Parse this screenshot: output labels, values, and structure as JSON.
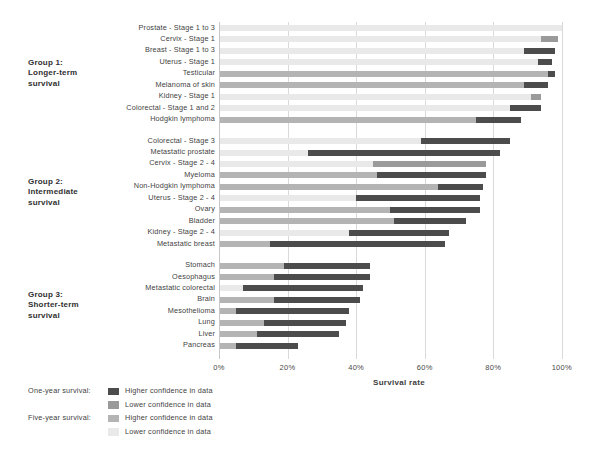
{
  "chart": {
    "type": "bar",
    "title": "",
    "xlabel": "Survival rate",
    "ylabel": "",
    "xlim": [
      0,
      105
    ],
    "xticks": [
      "0%",
      "20%",
      "40%",
      "60%",
      "80%",
      "100%"
    ],
    "xtick_values": [
      0,
      20,
      40,
      60,
      80,
      100
    ],
    "grid": "vertical",
    "orientation": "horizontal",
    "legend_position": "bottom-left"
  },
  "groups": [
    {
      "caption": "Group 1:\nLonger-term\nsurvival",
      "caption_lines": [
        "Group 1:",
        "Longer-term",
        "survival"
      ],
      "rows": [
        {
          "label": "Prostate - Stage 1 to 3",
          "five_year": 100,
          "one_year": 100,
          "five_year_confidence": "lower",
          "one_year_confidence": "lower"
        },
        {
          "label": "Cervix - Stage 1",
          "five_year": 94,
          "one_year": 99,
          "five_year_confidence": "lower",
          "one_year_confidence": "lower"
        },
        {
          "label": "Breast - Stage 1 to 3",
          "five_year": 89,
          "one_year": 98,
          "five_year_confidence": "lower",
          "one_year_confidence": "higher"
        },
        {
          "label": "Uterus - Stage 1",
          "five_year": 93,
          "one_year": 97,
          "five_year_confidence": "lower",
          "one_year_confidence": "higher"
        },
        {
          "label": "Testicular",
          "five_year": 96,
          "one_year": 98,
          "five_year_confidence": "higher",
          "one_year_confidence": "higher"
        },
        {
          "label": "Melanoma of skin",
          "five_year": 89,
          "one_year": 96,
          "five_year_confidence": "higher",
          "one_year_confidence": "higher"
        },
        {
          "label": "Kidney - Stage 1",
          "five_year": 91,
          "one_year": 94,
          "five_year_confidence": "lower",
          "one_year_confidence": "lower"
        },
        {
          "label": "Colorectal - Stage 1 and 2",
          "five_year": 85,
          "one_year": 94,
          "five_year_confidence": "lower",
          "one_year_confidence": "higher"
        },
        {
          "label": "Hodgkin lymphoma",
          "five_year": 75,
          "one_year": 88,
          "five_year_confidence": "higher",
          "one_year_confidence": "higher"
        }
      ]
    },
    {
      "caption": "Group 2:\nIntermediate\nsurvival",
      "caption_lines": [
        "Group 2:",
        "Intermediate",
        "survival"
      ],
      "rows": [
        {
          "label": "Colorectal - Stage 3",
          "five_year": 59,
          "one_year": 85,
          "five_year_confidence": "lower",
          "one_year_confidence": "higher"
        },
        {
          "label": "Metastatic prostate",
          "five_year": 26,
          "one_year": 82,
          "five_year_confidence": "lower",
          "one_year_confidence": "higher"
        },
        {
          "label": "Cervix - Stage 2 - 4",
          "five_year": 45,
          "one_year": 78,
          "five_year_confidence": "lower",
          "one_year_confidence": "lower"
        },
        {
          "label": "Myeloma",
          "five_year": 46,
          "one_year": 78,
          "five_year_confidence": "higher",
          "one_year_confidence": "higher"
        },
        {
          "label": "Non-Hodgkin lymphoma",
          "five_year": 64,
          "one_year": 77,
          "five_year_confidence": "higher",
          "one_year_confidence": "higher"
        },
        {
          "label": "Uterus - Stage 2 - 4",
          "five_year": 40,
          "one_year": 76,
          "five_year_confidence": "lower",
          "one_year_confidence": "higher"
        },
        {
          "label": "Ovary",
          "five_year": 50,
          "one_year": 76,
          "five_year_confidence": "higher",
          "one_year_confidence": "higher"
        },
        {
          "label": "Bladder",
          "five_year": 51,
          "one_year": 72,
          "five_year_confidence": "higher",
          "one_year_confidence": "higher"
        },
        {
          "label": "Kidney - Stage 2 - 4",
          "five_year": 38,
          "one_year": 67,
          "five_year_confidence": "lower",
          "one_year_confidence": "higher"
        },
        {
          "label": "Metastatic breast",
          "five_year": 15,
          "one_year": 66,
          "five_year_confidence": "higher",
          "one_year_confidence": "higher"
        }
      ]
    },
    {
      "caption": "Group 3:\nShorter-term\nsurvival",
      "caption_lines": [
        "Group 3:",
        "Shorter-term",
        "survival"
      ],
      "rows": [
        {
          "label": "Stomach",
          "five_year": 19,
          "one_year": 44,
          "five_year_confidence": "higher",
          "one_year_confidence": "higher"
        },
        {
          "label": "Oesophagus",
          "five_year": 16,
          "one_year": 44,
          "five_year_confidence": "higher",
          "one_year_confidence": "higher"
        },
        {
          "label": "Metastatic colorectal",
          "five_year": 7,
          "one_year": 42,
          "five_year_confidence": "lower",
          "one_year_confidence": "higher"
        },
        {
          "label": "Brain",
          "five_year": 16,
          "one_year": 41,
          "five_year_confidence": "higher",
          "one_year_confidence": "higher"
        },
        {
          "label": "Mesothelioma",
          "five_year": 5,
          "one_year": 38,
          "five_year_confidence": "higher",
          "one_year_confidence": "higher"
        },
        {
          "label": "Lung",
          "five_year": 13,
          "one_year": 37,
          "five_year_confidence": "higher",
          "one_year_confidence": "higher"
        },
        {
          "label": "Liver",
          "five_year": 11,
          "one_year": 35,
          "five_year_confidence": "higher",
          "one_year_confidence": "higher"
        },
        {
          "label": "Pancreas",
          "five_year": 5,
          "one_year": 23,
          "five_year_confidence": "higher",
          "one_year_confidence": "higher"
        }
      ]
    }
  ],
  "legend": {
    "one_year_label": "One-year survival:",
    "five_year_label": "Five-year survival:",
    "entries": [
      {
        "text": "Higher confidence in data",
        "shade": "#4c4c4c",
        "series": "one_year"
      },
      {
        "text": "Lower confidence in data",
        "shade": "#9a9a9a",
        "series": "one_year"
      },
      {
        "text": "Higher confidence in data",
        "shade": "#b4b4b4",
        "series": "five_year"
      },
      {
        "text": "Lower confidence in data",
        "shade": "#e9e9e9",
        "series": "five_year"
      }
    ]
  },
  "colors": {
    "one_year_higher": "#4c4c4c",
    "one_year_lower": "#9a9a9a",
    "five_year_higher": "#b4b4b4",
    "five_year_lower": "#e9e9e9",
    "gridline": "#d9d9d9",
    "text": "#3c3c3c",
    "background": "#ffffff"
  }
}
